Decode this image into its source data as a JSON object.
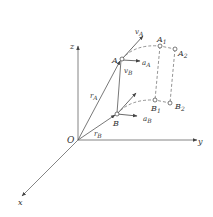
{
  "diagram": {
    "axes": {
      "x": "x",
      "y": "y",
      "z": "z",
      "origin": "O"
    },
    "points": {
      "A": "A",
      "B": "B",
      "A1": {
        "base": "A",
        "sub": "1"
      },
      "A2": {
        "base": "A",
        "sub": "2"
      },
      "B1": {
        "base": "B",
        "sub": "1"
      },
      "B2": {
        "base": "B",
        "sub": "2"
      }
    },
    "vectors": {
      "rA": {
        "base": "r",
        "sub": "A"
      },
      "rB": {
        "base": "r",
        "sub": "B"
      },
      "vA": {
        "base": "v",
        "sub": "A"
      },
      "vB": {
        "base": "v",
        "sub": "B"
      },
      "aA": {
        "base": "a",
        "sub": "A"
      },
      "aB": {
        "base": "a",
        "sub": "B"
      }
    },
    "colors": {
      "line": "#555555",
      "text": "#333333",
      "background": "#ffffff"
    }
  }
}
